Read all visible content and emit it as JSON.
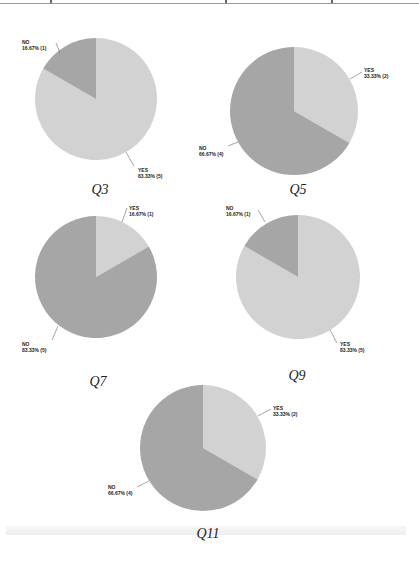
{
  "colors": {
    "yes": "#d2d2d2",
    "no": "#a6a6a6",
    "leader": "#666666",
    "text": "#222222"
  },
  "chart_data": [
    {
      "type": "pie",
      "title": "Q3",
      "categories": [
        "YES",
        "NO"
      ],
      "values": [
        83.33,
        16.67
      ],
      "counts": [
        5,
        1
      ],
      "labels": {
        "yes": "YES",
        "yes_value": "83.33% (5)",
        "no": "NO",
        "no_value": "16.67% (1)"
      }
    },
    {
      "type": "pie",
      "title": "Q5",
      "categories": [
        "YES",
        "NO"
      ],
      "values": [
        33.33,
        66.67
      ],
      "counts": [
        2,
        4
      ],
      "labels": {
        "yes": "YES",
        "yes_value": "33.33% (2)",
        "no": "NO",
        "no_value": "66.67% (4)"
      }
    },
    {
      "type": "pie",
      "title": "Q7",
      "categories": [
        "YES",
        "NO"
      ],
      "values": [
        16.67,
        83.33
      ],
      "counts": [
        1,
        5
      ],
      "labels": {
        "yes": "YES",
        "yes_value": "16.67% (1)",
        "no": "NO",
        "no_value": "83.33% (5)"
      }
    },
    {
      "type": "pie",
      "title": "Q9",
      "categories": [
        "YES",
        "NO"
      ],
      "values": [
        83.33,
        16.67
      ],
      "counts": [
        5,
        1
      ],
      "labels": {
        "yes": "YES",
        "yes_value": "83.33% (5)",
        "no": "NO",
        "no_value": "16.67% (1)"
      }
    },
    {
      "type": "pie",
      "title": "Q11",
      "categories": [
        "YES",
        "NO"
      ],
      "values": [
        33.33,
        66.67
      ],
      "counts": [
        2,
        4
      ],
      "labels": {
        "yes": "YES",
        "yes_value": "33.33% (2)",
        "no": "NO",
        "no_value": "66.67% (4)"
      }
    }
  ]
}
